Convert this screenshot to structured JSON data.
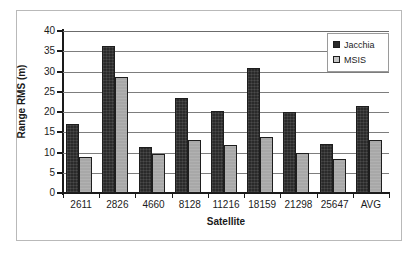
{
  "chart_data": {
    "type": "bar",
    "title": "",
    "xlabel": "Satellite",
    "ylabel": "Range RMS (m)",
    "categories": [
      "2611",
      "2826",
      "4660",
      "8128",
      "11216",
      "18159",
      "21298",
      "25647",
      "AVG"
    ],
    "series": [
      {
        "name": "Jacchia",
        "color": "#2a2a2a",
        "values": [
          17.0,
          36.4,
          11.3,
          23.5,
          20.3,
          30.8,
          20.0,
          12.0,
          21.6
        ]
      },
      {
        "name": "MSIS",
        "color": "#a8a8a8",
        "values": [
          9.0,
          28.7,
          9.6,
          13.2,
          11.9,
          13.8,
          10.0,
          8.4,
          13.2
        ]
      }
    ],
    "ylim": [
      0,
      40
    ],
    "ytick_step": 5,
    "yticks": [
      "0",
      "5",
      "10",
      "15",
      "20",
      "25",
      "30",
      "35",
      "40"
    ],
    "grid": "horizontal",
    "legend_position": "top-right",
    "legend_entries": [
      "Jacchia",
      "MSIS"
    ]
  },
  "axes": {
    "y_title": "Range RMS (m)",
    "x_title": "Satellite"
  }
}
